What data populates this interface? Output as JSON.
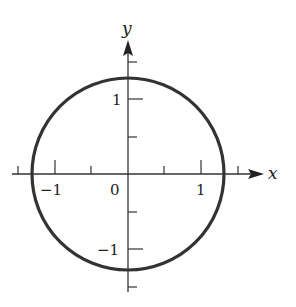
{
  "figure": {
    "axes": {
      "x_label": "x",
      "y_label": "y",
      "origin_label": "0",
      "x_tick_labels": [
        "-1",
        "1"
      ],
      "y_tick_labels": [
        "1",
        "-1"
      ],
      "tick_spacing": 0.5
    },
    "circle": {
      "center": [
        0,
        0
      ],
      "radius_approx": 1.33,
      "stroke_color": "#333333"
    },
    "colors": {
      "axis": "#333333",
      "circle": "#333333",
      "background": "#ffffff"
    }
  }
}
